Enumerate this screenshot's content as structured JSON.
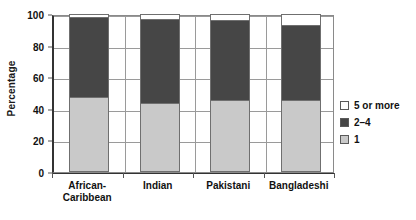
{
  "chart_data": {
    "type": "bar",
    "subtype": "stacked-percentage",
    "title": "",
    "xlabel": "",
    "ylabel": "Percentage",
    "ylim": [
      0,
      100
    ],
    "yticks": [
      0,
      20,
      40,
      60,
      80,
      100
    ],
    "grid": true,
    "legend_position": "right",
    "categories": [
      "African-\nCaribbean",
      "Indian",
      "Pakistani",
      "Bangladeshi"
    ],
    "category_labels_flat": [
      "African-Caribbean",
      "Indian",
      "Pakistani",
      "Bangladeshi"
    ],
    "series": [
      {
        "name": "1",
        "color": "#c9c9c9",
        "values": [
          47,
          43,
          45,
          45
        ]
      },
      {
        "name": "2–4",
        "color": "#464646",
        "values": [
          51,
          54,
          51,
          48
        ]
      },
      {
        "name": "5 or more",
        "color": "#ffffff",
        "values": [
          2,
          3,
          4,
          7
        ]
      }
    ],
    "cumulative_tops": [
      98,
      97,
      96,
      93
    ]
  },
  "axis": {
    "y_title": "Percentage",
    "ticks": [
      {
        "label": "100",
        "value": 100
      },
      {
        "label": "80",
        "value": 80
      },
      {
        "label": "60",
        "value": 60
      },
      {
        "label": "40",
        "value": 40
      },
      {
        "label": "20",
        "value": 20
      },
      {
        "label": "0",
        "value": 0
      }
    ]
  },
  "legend": {
    "items": [
      {
        "label": "5 or more",
        "color": "#ffffff"
      },
      {
        "label": "2–4",
        "color": "#464646"
      },
      {
        "label": "1",
        "color": "#c9c9c9"
      }
    ]
  }
}
